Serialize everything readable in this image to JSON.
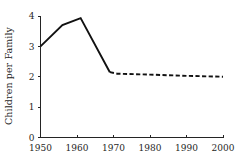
{
  "chart_data": {
    "type": "line",
    "title": "",
    "subtitle": "",
    "xlabel": "",
    "ylabel": "Children per Family",
    "xlim": [
      1950,
      2000
    ],
    "ylim": [
      0,
      4
    ],
    "grid": false,
    "legend": false,
    "legend_position": "none",
    "x_ticks": [
      1950,
      1960,
      1970,
      1980,
      1990,
      2000
    ],
    "y_ticks": [
      0,
      1,
      2,
      3,
      4
    ],
    "x_tick_labels": [
      "1950",
      "1960",
      "1970",
      "1980",
      "1990",
      "2000"
    ],
    "y_tick_labels": [
      "0",
      "1",
      "2",
      "3",
      "4"
    ],
    "line_color": "#111111",
    "axis_color": "#242424",
    "background_color": "#ffffff",
    "series": [
      {
        "name": "Historical",
        "style": "solid",
        "x": [
          1950,
          1956,
          1961,
          1969
        ],
        "values": [
          3.0,
          3.7,
          3.93,
          2.15
        ]
      },
      {
        "name": "Projected",
        "style": "dashed",
        "x": [
          1969,
          1971,
          1980,
          1990,
          2000
        ],
        "values": [
          2.15,
          2.1,
          2.07,
          2.03,
          2.0
        ]
      }
    ],
    "annotations": []
  },
  "axis_titles": {
    "y": "Children per Family",
    "x": ""
  }
}
